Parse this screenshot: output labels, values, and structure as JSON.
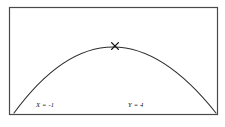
{
  "figure": {
    "background_color": "#ffffff",
    "frame_color": "#4a4a4a",
    "curve_color": "#2b2b2b",
    "marker_color": "#111111",
    "label_color": "#111111",
    "marker_glyph": "✕"
  },
  "labels": {
    "x_label": "X = -1",
    "y_label": "Y = 4"
  },
  "chart_data": {
    "type": "line",
    "title": "",
    "xlabel": "",
    "ylabel": "",
    "grid": false,
    "legend": null,
    "frame": {
      "x0": 9,
      "y0": 7,
      "x1": 217,
      "y1": 114
    },
    "annotations": [
      {
        "name": "x-value-label",
        "text": "X = -1",
        "x": 38,
        "y": 106
      },
      {
        "name": "y-value-label",
        "text": "Y = 4",
        "x": 130,
        "y": 106
      },
      {
        "name": "vertex-marker",
        "text": "✕",
        "x": 115,
        "y": 46
      }
    ],
    "series": [
      {
        "name": "parabola",
        "shape": "downward-opening parabola",
        "vertex": {
          "x": 113,
          "y": 47
        },
        "endpoints": [
          {
            "x": 14,
            "y": 113
          },
          {
            "x": 216,
            "y": 113
          }
        ],
        "x": [
          14,
          24,
          34,
          44,
          54,
          64,
          74,
          84,
          94,
          104,
          113,
          124,
          134,
          144,
          154,
          164,
          174,
          184,
          194,
          204,
          216
        ],
        "y": [
          113,
          99.2,
          87.2,
          77.0,
          68.5,
          61.8,
          56.8,
          53.6,
          51.1,
          48.2,
          47.0,
          47.9,
          49.9,
          53.5,
          58.9,
          66.0,
          74.8,
          85.3,
          97.6,
          111.6,
          113
        ]
      }
    ]
  }
}
